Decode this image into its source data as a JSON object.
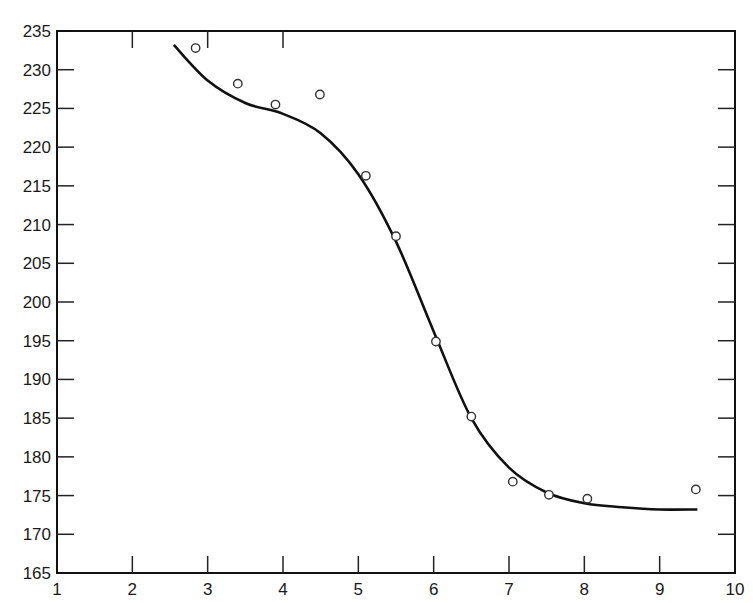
{
  "chart_data": {
    "type": "scatter",
    "title": "",
    "xlabel": "",
    "ylabel": "",
    "xlim": [
      1,
      10
    ],
    "ylim": [
      165,
      235
    ],
    "x_ticks": [
      "1",
      "2",
      "3",
      "4",
      "5",
      "6",
      "7",
      "8",
      "9",
      "10"
    ],
    "y_ticks": [
      "165",
      "170",
      "175",
      "180",
      "185",
      "190",
      "195",
      "200",
      "205",
      "210",
      "215",
      "220",
      "225",
      "230",
      "235"
    ],
    "grid": false,
    "legend": null,
    "series": [
      {
        "name": "observed points",
        "marker": "open-circle",
        "x": [
          2.84,
          3.4,
          3.9,
          4.49,
          5.1,
          5.5,
          6.03,
          6.5,
          7.05,
          7.53,
          8.04,
          9.48
        ],
        "y": [
          232.8,
          228.2,
          225.5,
          226.8,
          216.3,
          208.5,
          194.9,
          185.2,
          176.8,
          175.1,
          174.6,
          175.8
        ]
      },
      {
        "name": "fitted curve",
        "type": "line",
        "x": [
          2.55,
          3.0,
          3.5,
          4.0,
          4.5,
          5.0,
          5.5,
          6.0,
          6.5,
          7.0,
          7.5,
          8.0,
          8.5,
          9.0,
          9.5
        ],
        "y": [
          233.2,
          228.6,
          225.7,
          224.3,
          221.8,
          216.5,
          207.8,
          196.2,
          185.0,
          178.6,
          175.4,
          174.0,
          173.5,
          173.2,
          173.2
        ]
      }
    ]
  }
}
